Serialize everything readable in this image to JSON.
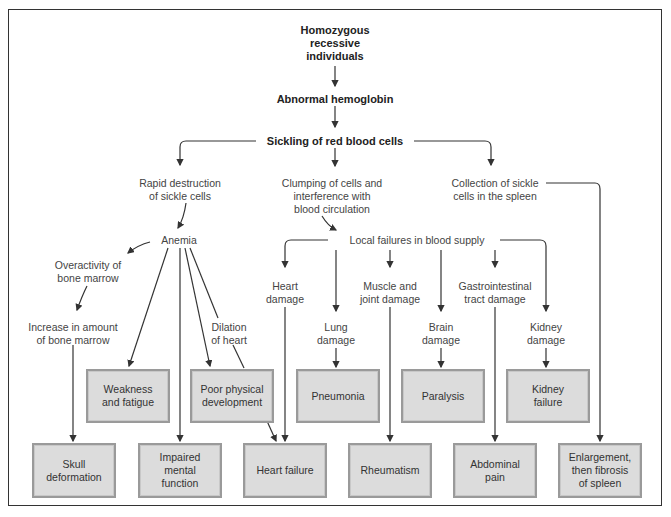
{
  "diagram": {
    "title_nodes": {
      "root": "Homozygous\nrecessive\nindividuals",
      "hemoglobin": "Abnormal hemoglobin",
      "sickling": "Sickling of red blood cells"
    },
    "branches": {
      "rapid_destruction": "Rapid destruction\nof sickle cells",
      "clumping": "Clumping of cells and\ninterference with\nblood circulation",
      "spleen_collection": "Collection of sickle\ncells in the spleen"
    },
    "intermediate": {
      "anemia": "Anemia",
      "local_failures": "Local failures in blood supply",
      "overactivity": "Overactivity of\nbone marrow",
      "increase_marrow": "Increase in amount\nof bone marrow",
      "dilation": "Dilation\nof heart",
      "heart_damage": "Heart\ndamage",
      "lung_damage": "Lung\ndamage",
      "muscle_joint": "Muscle and\njoint damage",
      "brain_damage": "Brain\ndamage",
      "gi_damage": "Gastrointestinal\ntract damage",
      "kidney_damage": "Kidney\ndamage"
    },
    "outcomes_row1": {
      "weakness": "Weakness\nand fatigue",
      "poor_development": "Poor physical\ndevelopment",
      "pneumonia": "Pneumonia",
      "paralysis": "Paralysis",
      "kidney_failure": "Kidney\nfailure"
    },
    "outcomes_row2": {
      "skull": "Skull\ndeformation",
      "impaired": "Impaired\nmental\nfunction",
      "heart_failure": "Heart failure",
      "rheumatism": "Rheumatism",
      "abdominal": "Abdominal\npain",
      "spleen_fibrosis": "Enlargement,\nthen fibrosis\nof spleen"
    },
    "colors": {
      "box_fill": "#dcdcdc",
      "box_border": "#9a9a9a",
      "line": "#333333",
      "text": "#444444"
    }
  }
}
